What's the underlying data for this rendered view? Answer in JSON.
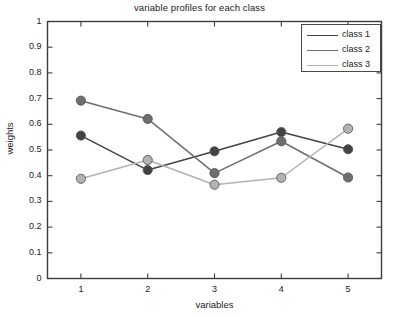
{
  "chart_data": {
    "type": "line",
    "title": "variable profiles for each class",
    "xlabel": "variables",
    "ylabel": "weights",
    "x": [
      1,
      2,
      3,
      4,
      5
    ],
    "categories": [
      "1",
      "2",
      "3",
      "4",
      "5"
    ],
    "xlim": [
      0.5,
      5.5
    ],
    "ylim": [
      0,
      1
    ],
    "xticks": [
      "1",
      "2",
      "3",
      "4",
      "5"
    ],
    "yticks": [
      "0",
      "0.1",
      "0.2",
      "0.3",
      "0.4",
      "0.5",
      "0.6",
      "0.7",
      "0.8",
      "0.9",
      "1"
    ],
    "grid": false,
    "legend_position": "upper right",
    "marker": "filled-circle",
    "series": [
      {
        "name": "class 1",
        "values": [
          0.556,
          0.422,
          0.495,
          0.57,
          0.503
        ],
        "color": "#434343"
      },
      {
        "name": "class 2",
        "values": [
          0.692,
          0.621,
          0.41,
          0.534,
          0.393
        ],
        "color": "#6e6e6e"
      },
      {
        "name": "class 3",
        "values": [
          0.388,
          0.461,
          0.365,
          0.392,
          0.583
        ],
        "color": "#b2b2b2"
      }
    ]
  },
  "axes": {
    "frame_color": "#3c3c3c",
    "background": "#ffffff"
  }
}
